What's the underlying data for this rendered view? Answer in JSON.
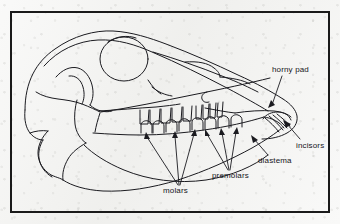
{
  "figure": {
    "frame": {
      "border_color": "#1a1a1a",
      "border_width": 2
    },
    "background_color": "#f3f3f1",
    "ink_color": "#1a1a20"
  },
  "labels": [
    {
      "id": "horny-pad",
      "text": "horny pad"
    },
    {
      "id": "incisors",
      "text": "incisors"
    },
    {
      "id": "diastema",
      "text": "diastema"
    },
    {
      "id": "premolars",
      "text": "premolars"
    },
    {
      "id": "molars",
      "text": "molars"
    }
  ],
  "parts": {
    "cranium": "cranium-outline",
    "orbit": "eye-socket-circle",
    "nasal": "nasal-bone",
    "zygomatic": "zygomatic-arch",
    "mandible": "lower-jaw-outline",
    "upper_tooth_row": "upper-cheek-teeth",
    "lower_tooth_row": "lower-cheek-teeth",
    "incisor_group": "lower-incisor-teeth",
    "horny_pad_region": "upper-front-pad"
  }
}
